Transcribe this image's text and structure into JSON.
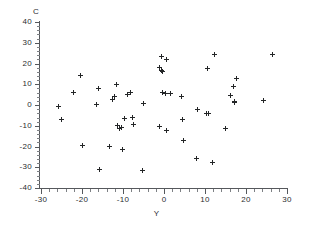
{
  "chart_data": {
    "type": "scatter",
    "title": "",
    "xlabel": "Y",
    "ylabel": "C",
    "xlim": [
      -30,
      30
    ],
    "ylim": [
      -40,
      40
    ],
    "xticks": [
      -30,
      -20,
      -10,
      0,
      10,
      20,
      30
    ],
    "yticks": [
      40,
      30,
      20,
      10,
      0,
      -10,
      -20,
      -30,
      -40
    ],
    "xtick_labels": [
      "-30",
      "-20",
      "-10",
      "0",
      "10",
      "20",
      "30"
    ],
    "ytick_labels": [
      "40",
      "30",
      "20",
      "10",
      "0",
      "-10",
      "-20",
      "-30",
      "-40"
    ],
    "grid": false,
    "legend": null,
    "marker": "plus",
    "marker_color": "#232527",
    "axis_color": "#55585c",
    "background": "#ffffff",
    "n_points": 58,
    "points": [
      [
        -25.8,
        -0.7
      ],
      [
        -25.1,
        -7.0
      ],
      [
        -22.2,
        6.2
      ],
      [
        -20.3,
        14.0
      ],
      [
        -19.9,
        -19.6
      ],
      [
        -16.4,
        0.1
      ],
      [
        -16.1,
        7.9
      ],
      [
        -15.8,
        -31.0
      ],
      [
        -13.4,
        -20.2
      ],
      [
        -12.6,
        2.6
      ],
      [
        -12.2,
        4.1
      ],
      [
        -11.5,
        9.7
      ],
      [
        -11.3,
        -9.9
      ],
      [
        -10.9,
        -11.2
      ],
      [
        -10.3,
        -11.0
      ],
      [
        -10.1,
        -21.5
      ],
      [
        -9.6,
        -6.6
      ],
      [
        -8.8,
        5.1
      ],
      [
        -8.2,
        6.0
      ],
      [
        -7.7,
        -5.9
      ],
      [
        -7.4,
        -9.6
      ],
      [
        -5.2,
        -31.6
      ],
      [
        -5.0,
        0.8
      ],
      [
        -1.2,
        17.9
      ],
      [
        -1.0,
        -10.2
      ],
      [
        -0.7,
        16.7
      ],
      [
        -0.6,
        23.2
      ],
      [
        -0.4,
        16.3
      ],
      [
        -0.3,
        5.9
      ],
      [
        0.3,
        5.8
      ],
      [
        0.5,
        21.9
      ],
      [
        0.6,
        -12.1
      ],
      [
        1.5,
        5.8
      ],
      [
        4.2,
        4.1
      ],
      [
        4.4,
        -7.0
      ],
      [
        4.7,
        -16.9
      ],
      [
        7.9,
        -25.8
      ],
      [
        8.2,
        -2.2
      ],
      [
        10.3,
        -3.9
      ],
      [
        10.6,
        17.4
      ],
      [
        10.9,
        -4.2
      ],
      [
        11.9,
        -27.6
      ],
      [
        12.2,
        24.3
      ],
      [
        14.9,
        -11.5
      ],
      [
        16.3,
        4.8
      ],
      [
        16.9,
        8.8
      ],
      [
        17.1,
        1.8
      ],
      [
        17.3,
        1.4
      ],
      [
        17.6,
        12.9
      ],
      [
        24.3,
        2.1
      ],
      [
        26.4,
        24.6
      ]
    ]
  }
}
